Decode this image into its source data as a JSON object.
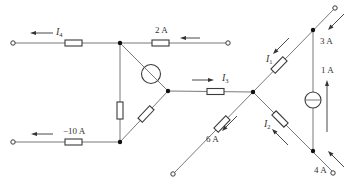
{
  "diagram": {
    "type": "circuit",
    "labels": {
      "I4": {
        "symbol": "I",
        "sub": "4"
      },
      "I3": {
        "symbol": "I",
        "sub": "3"
      },
      "I1": {
        "symbol": "I",
        "sub": "1"
      },
      "I2": {
        "symbol": "I",
        "sub": "2"
      },
      "top_right_current": "2 A",
      "bottom_left_current": "−10 A",
      "right_top_current": "3 A",
      "source_current": "1 A",
      "bottom_right_current": "4 A",
      "bottom_mid_current": "6 A"
    },
    "colors": {
      "wire": "#6a6a6a",
      "component": "#3a3a3a",
      "node": "#111111",
      "text": "#333333"
    }
  }
}
